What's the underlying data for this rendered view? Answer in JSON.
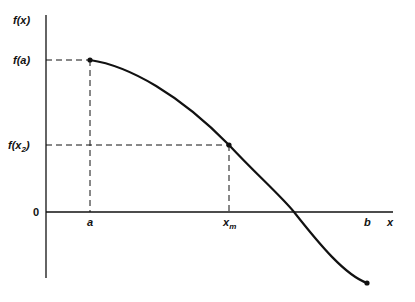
{
  "diagram": {
    "type": "function-graph",
    "y_axis_label": "f(x)",
    "x_axis_label": "x",
    "origin_label": "0",
    "y_ticks": [
      {
        "label": "f(a)",
        "base": "f(",
        "var": "a",
        "close": ")"
      },
      {
        "label": "f(x2)",
        "base": "f(",
        "var": "x",
        "sub": "2",
        "close": ")"
      }
    ],
    "x_ticks": [
      {
        "label": "a",
        "var": "a"
      },
      {
        "label": "x_m",
        "var": "x",
        "sub": "m"
      },
      {
        "label": "b",
        "var": "b"
      }
    ],
    "points": [
      {
        "name": "start-point",
        "at": "a",
        "value": "f(a)"
      },
      {
        "name": "mid-point",
        "at": "x_m",
        "value": "f(x2)"
      },
      {
        "name": "end-point",
        "at": "b"
      }
    ],
    "colors": {
      "line": "#111111",
      "background": "#ffffff"
    }
  }
}
